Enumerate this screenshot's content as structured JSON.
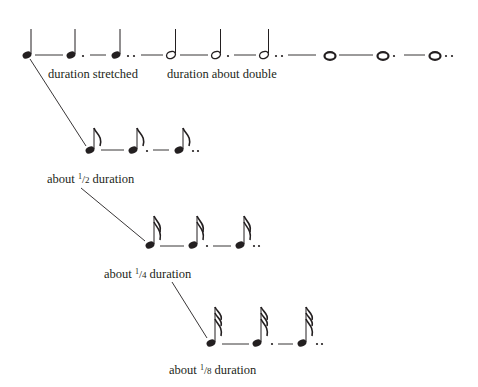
{
  "diagram": {
    "ink_color": "#231f20",
    "rows": [
      {
        "id": "quarter-half-whole",
        "notes": [
          "quarter",
          "dotted-quarter",
          "double-dotted-quarter",
          "half",
          "dotted-half",
          "double-dotted-half",
          "whole",
          "dotted-whole",
          "double-dotted-whole"
        ]
      },
      {
        "id": "eighth",
        "notes": [
          "eighth",
          "dotted-eighth",
          "double-dotted-eighth"
        ]
      },
      {
        "id": "sixteenth",
        "notes": [
          "sixteenth",
          "dotted-sixteenth",
          "double-dotted-sixteenth"
        ]
      },
      {
        "id": "thirty-second",
        "notes": [
          "thirty-second",
          "dotted-thirty-second",
          "double-dotted-thirty-second"
        ]
      }
    ],
    "labels": {
      "stretched": "duration stretched",
      "double": "duration about double",
      "half": {
        "prefix": "about ",
        "num": "1",
        "den": "2",
        "suffix": " duration"
      },
      "quarter": {
        "prefix": "about ",
        "num": "1",
        "den": "4",
        "suffix": " duration"
      },
      "eighth": {
        "prefix": "about ",
        "num": "1",
        "den": "8",
        "suffix": " duration"
      }
    }
  }
}
